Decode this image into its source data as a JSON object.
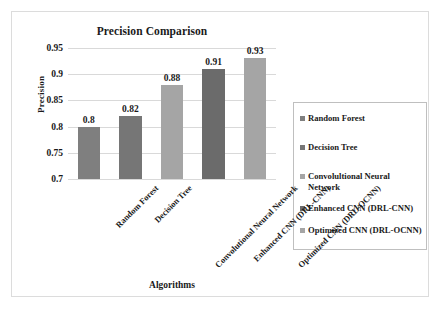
{
  "chart_data": {
    "type": "bar",
    "title": "Precision Comparison",
    "xlabel": "Algorithms",
    "ylabel": "Precision",
    "categories": [
      "Random Forest",
      "Decision Tree",
      "Convolutional Neural Network",
      "Enhanced CNN (DRL-CNN)",
      "Optimized CNN (DRL-OCNN)"
    ],
    "values": [
      0.8,
      0.82,
      0.88,
      0.91,
      0.93
    ],
    "value_labels": [
      "0.8",
      "0.82",
      "0.88",
      "0.91",
      "0.93"
    ],
    "ylim": [
      0.7,
      0.95
    ],
    "ytick_labels": [
      "0.7",
      "0.75",
      "0.8",
      "0.85",
      "0.9",
      "0.95"
    ],
    "ytick_values": [
      0.7,
      0.75,
      0.8,
      0.85,
      0.9,
      0.95
    ],
    "grid": "horizontal",
    "legend_position": "right",
    "bar_colors": [
      "#7f7f7f",
      "#767676",
      "#a5a5a5",
      "#6b6b6b",
      "#a5a5a5"
    ],
    "legend": [
      {
        "label": "Random Forest",
        "color": "#7f7f7f"
      },
      {
        "label": "Decision Tree",
        "color": "#767676"
      },
      {
        "label": "Convolultional Neural Network",
        "color": "#a5a5a5"
      },
      {
        "label": "Enhanced CNN (DRL-CNN)",
        "color": "#6b6b6b"
      },
      {
        "label": "Optimized CNN (DRL-OCNN)",
        "color": "#a5a5a5"
      }
    ]
  },
  "style": {
    "frame_border_color": "#dcdcdc",
    "gridline_color": "#d9d9d9",
    "legend_border_color": "#bfbfbf",
    "text_color": "#1a1a1a",
    "background": "#ffffff"
  }
}
